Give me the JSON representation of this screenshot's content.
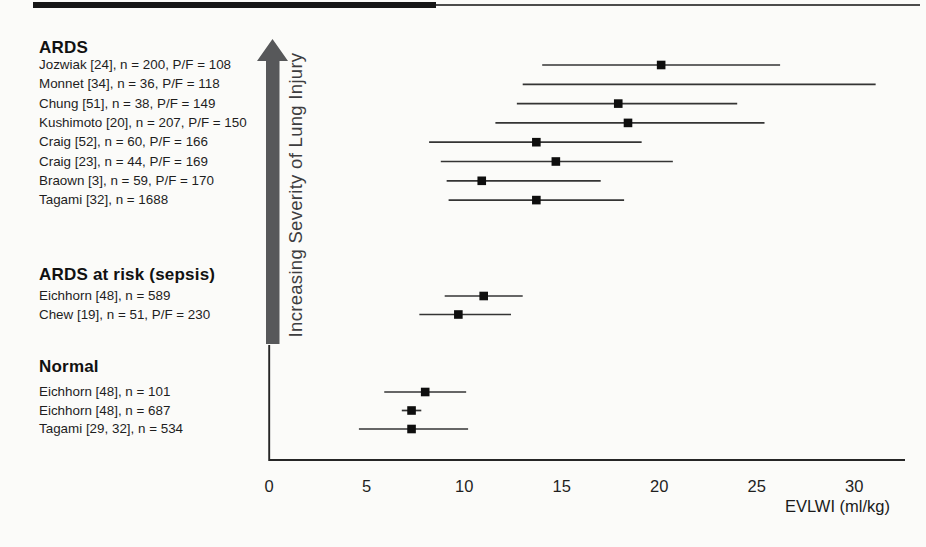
{
  "figure": {
    "arrow_label": "Increasing Severity of Lung Injury",
    "xlabel": "EVLWI (ml/kg)"
  },
  "chart_data": {
    "type": "forest",
    "xlabel": "EVLWI (ml/kg)",
    "xlim": [
      0,
      32.5
    ],
    "x_ticks": [
      0,
      5,
      10,
      15,
      20,
      25,
      30
    ],
    "grid": false,
    "arrow_annotation": "Increasing Severity of Lung Injury",
    "marker": "filled-square",
    "colors": {
      "marker": "#0e0e0e",
      "line": "#343434",
      "arrow": "#57585a",
      "text": "#1c1c1c"
    },
    "groups": [
      {
        "label": "ARDS",
        "entries": [
          {
            "label": "Jozwiak [24], n = 200, P/F = 108",
            "mean": 20.1,
            "lo": 14.0,
            "hi": 26.2
          },
          {
            "label": "Monnet [34], n = 36, P/F = 118",
            "mean": null,
            "lo": 13.0,
            "hi": 31.1
          },
          {
            "label": "Chung [51], n = 38, P/F = 149",
            "mean": 17.9,
            "lo": 12.7,
            "hi": 24.0
          },
          {
            "label": "Kushimoto [20], n = 207, P/F = 150",
            "mean": 18.4,
            "lo": 11.6,
            "hi": 25.4
          },
          {
            "label": "Craig [52], n = 60, P/F = 166",
            "mean": 13.7,
            "lo": 8.2,
            "hi": 19.1
          },
          {
            "label": "Craig [23], n = 44, P/F = 169",
            "mean": 14.7,
            "lo": 8.8,
            "hi": 20.7
          },
          {
            "label": "Braown [3], n = 59, P/F = 170",
            "mean": 10.9,
            "lo": 9.1,
            "hi": 17.0
          },
          {
            "label": "Tagami [32], n = 1688",
            "mean": 13.7,
            "lo": 9.2,
            "hi": 18.2
          }
        ]
      },
      {
        "label": "ARDS at risk (sepsis)",
        "entries": [
          {
            "label": "Eichhorn [48], n = 589",
            "mean": 11.0,
            "lo": 9.0,
            "hi": 13.0
          },
          {
            "label": "Chew [19], n = 51, P/F = 230",
            "mean": 9.7,
            "lo": 7.7,
            "hi": 12.4
          }
        ]
      },
      {
        "label": "Normal",
        "entries": [
          {
            "label": "Eichhorn [48], n = 101",
            "mean": 8.0,
            "lo": 5.9,
            "hi": 10.1
          },
          {
            "label": "Eichhorn [48], n = 687",
            "mean": 7.3,
            "lo": 6.8,
            "hi": 7.8
          },
          {
            "label": "Tagami [29, 32], n = 534",
            "mean": 7.3,
            "lo": 4.6,
            "hi": 10.2
          }
        ]
      }
    ]
  }
}
